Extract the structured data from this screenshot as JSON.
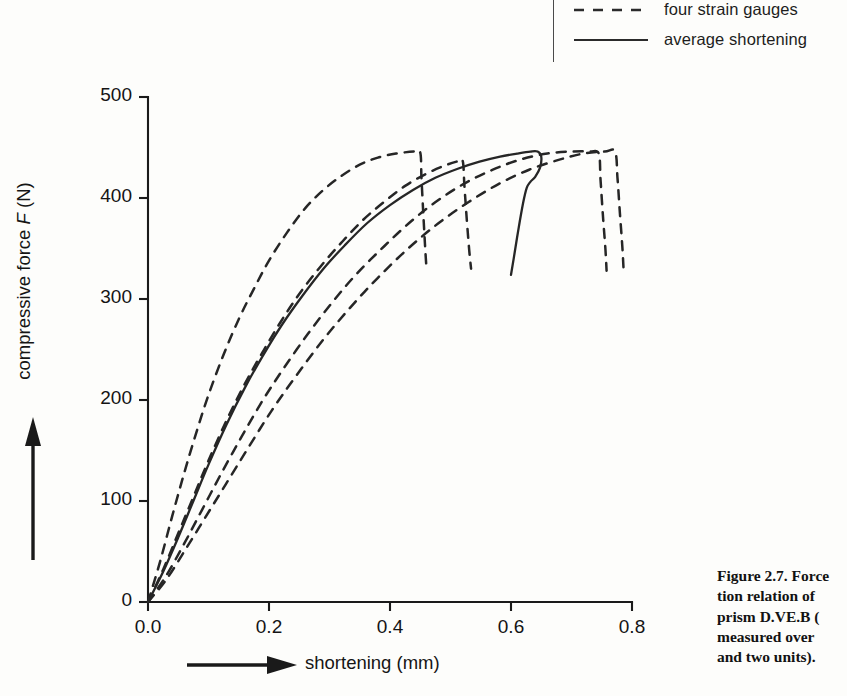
{
  "figure": {
    "caption_lines": [
      "Figure 2.7. Force",
      "tion relation of",
      "prism D.VE.B (",
      "measured  over",
      "and two units)."
    ]
  },
  "legend": {
    "position": "top-right",
    "entries": [
      {
        "label": "four strain gauges",
        "style": "dashed",
        "icon": "dashed-line-sample"
      },
      {
        "label": "average shortening",
        "style": "solid",
        "icon": "solid-line-sample"
      }
    ]
  },
  "chart_data": {
    "type": "line",
    "title": "",
    "xlabel": "shortening (mm)",
    "ylabel": "compressive force F (N)",
    "xlim": [
      0.0,
      0.8
    ],
    "ylim": [
      0,
      500
    ],
    "xticks": [
      "0.0",
      "0.2",
      "0.4",
      "0.6",
      "0.8"
    ],
    "xtick_values": [
      0.0,
      0.2,
      0.4,
      0.6,
      0.8
    ],
    "yticks": [
      "0",
      "100",
      "200",
      "300",
      "400",
      "500"
    ],
    "ytick_values": [
      0,
      100,
      200,
      300,
      400,
      500
    ],
    "grid": false,
    "legend_position": "top-right",
    "series": [
      {
        "name": "strain gauge 1",
        "style": "dashed",
        "points": [
          [
            0.0,
            0
          ],
          [
            0.02,
            40
          ],
          [
            0.04,
            85
          ],
          [
            0.06,
            128
          ],
          [
            0.08,
            168
          ],
          [
            0.1,
            205
          ],
          [
            0.125,
            245
          ],
          [
            0.15,
            280
          ],
          [
            0.175,
            310
          ],
          [
            0.2,
            338
          ],
          [
            0.23,
            366
          ],
          [
            0.26,
            390
          ],
          [
            0.29,
            408
          ],
          [
            0.32,
            422
          ],
          [
            0.35,
            433
          ],
          [
            0.38,
            440
          ],
          [
            0.41,
            444
          ],
          [
            0.44,
            446
          ],
          [
            0.45,
            445
          ],
          [
            0.452,
            420
          ],
          [
            0.455,
            385
          ],
          [
            0.458,
            352
          ],
          [
            0.46,
            333
          ]
        ]
      },
      {
        "name": "strain gauge 2",
        "style": "dashed",
        "points": [
          [
            0.0,
            0
          ],
          [
            0.025,
            32
          ],
          [
            0.05,
            68
          ],
          [
            0.075,
            104
          ],
          [
            0.1,
            140
          ],
          [
            0.13,
            180
          ],
          [
            0.16,
            216
          ],
          [
            0.19,
            248
          ],
          [
            0.22,
            278
          ],
          [
            0.25,
            305
          ],
          [
            0.285,
            332
          ],
          [
            0.32,
            356
          ],
          [
            0.355,
            378
          ],
          [
            0.39,
            396
          ],
          [
            0.425,
            412
          ],
          [
            0.46,
            424
          ],
          [
            0.49,
            432
          ],
          [
            0.51,
            436
          ],
          [
            0.52,
            437
          ],
          [
            0.523,
            412
          ],
          [
            0.527,
            378
          ],
          [
            0.531,
            348
          ],
          [
            0.534,
            330
          ]
        ]
      },
      {
        "name": "strain gauge 3",
        "style": "dashed",
        "points": [
          [
            0.0,
            0
          ],
          [
            0.03,
            26
          ],
          [
            0.06,
            58
          ],
          [
            0.09,
            92
          ],
          [
            0.12,
            126
          ],
          [
            0.155,
            164
          ],
          [
            0.19,
            200
          ],
          [
            0.225,
            232
          ],
          [
            0.265,
            266
          ],
          [
            0.305,
            297
          ],
          [
            0.345,
            325
          ],
          [
            0.39,
            352
          ],
          [
            0.435,
            377
          ],
          [
            0.48,
            398
          ],
          [
            0.525,
            415
          ],
          [
            0.57,
            428
          ],
          [
            0.615,
            438
          ],
          [
            0.66,
            444
          ],
          [
            0.7,
            446
          ],
          [
            0.73,
            446
          ],
          [
            0.745,
            444
          ],
          [
            0.748,
            418
          ],
          [
            0.752,
            382
          ],
          [
            0.756,
            350
          ],
          [
            0.758,
            328
          ]
        ]
      },
      {
        "name": "strain gauge 4",
        "style": "dashed",
        "points": [
          [
            0.0,
            0
          ],
          [
            0.03,
            22
          ],
          [
            0.062,
            52
          ],
          [
            0.095,
            84
          ],
          [
            0.128,
            116
          ],
          [
            0.165,
            152
          ],
          [
            0.205,
            190
          ],
          [
            0.245,
            224
          ],
          [
            0.29,
            260
          ],
          [
            0.335,
            292
          ],
          [
            0.38,
            321
          ],
          [
            0.43,
            350
          ],
          [
            0.48,
            375
          ],
          [
            0.53,
            396
          ],
          [
            0.58,
            414
          ],
          [
            0.63,
            428
          ],
          [
            0.68,
            438
          ],
          [
            0.72,
            444
          ],
          [
            0.755,
            446
          ],
          [
            0.772,
            446
          ],
          [
            0.776,
            420
          ],
          [
            0.78,
            385
          ],
          [
            0.784,
            352
          ],
          [
            0.786,
            330
          ]
        ]
      },
      {
        "name": "average shortening",
        "style": "solid",
        "points": [
          [
            0.0,
            0
          ],
          [
            0.025,
            30
          ],
          [
            0.05,
            64
          ],
          [
            0.075,
            100
          ],
          [
            0.1,
            136
          ],
          [
            0.13,
            176
          ],
          [
            0.16,
            212
          ],
          [
            0.19,
            244
          ],
          [
            0.222,
            275
          ],
          [
            0.255,
            303
          ],
          [
            0.29,
            330
          ],
          [
            0.325,
            353
          ],
          [
            0.362,
            375
          ],
          [
            0.4,
            393
          ],
          [
            0.438,
            408
          ],
          [
            0.475,
            420
          ],
          [
            0.512,
            429
          ],
          [
            0.548,
            436
          ],
          [
            0.582,
            441
          ],
          [
            0.61,
            444
          ],
          [
            0.632,
            446
          ],
          [
            0.644,
            446
          ],
          [
            0.65,
            441
          ],
          [
            0.648,
            430
          ],
          [
            0.64,
            421
          ],
          [
            0.632,
            416
          ],
          [
            0.626,
            410
          ],
          [
            0.62,
            395
          ],
          [
            0.612,
            368
          ],
          [
            0.605,
            342
          ],
          [
            0.6,
            324
          ]
        ]
      }
    ]
  }
}
